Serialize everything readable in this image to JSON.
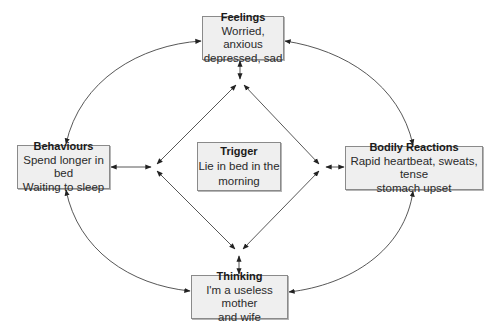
{
  "diagram": {
    "type": "CBT cycle / five-areas model",
    "nodes": {
      "feelings": {
        "title": "Feelings",
        "line1": "Worried, anxious",
        "line2": "depressed, sad"
      },
      "behaviours": {
        "title": "Behaviours",
        "line1": "Spend longer in bed",
        "line2": "Waiting to sleep"
      },
      "trigger": {
        "title": "Trigger",
        "line1": "Lie in bed in the",
        "line2": "morning"
      },
      "bodily": {
        "title": "Bodily Reactions",
        "line1": "Rapid heartbeat, sweats, tense",
        "line2": "stomach upset"
      },
      "thinking": {
        "title": "Thinking",
        "line1": "I'm a useless mother",
        "line2": "and wife"
      }
    },
    "edges": [
      {
        "from": "Feelings",
        "to": "Behaviours",
        "style": "curved",
        "arrows": "both"
      },
      {
        "from": "Feelings",
        "to": "Bodily Reactions",
        "style": "curved",
        "arrows": "both"
      },
      {
        "from": "Behaviours",
        "to": "Thinking",
        "style": "curved",
        "arrows": "both"
      },
      {
        "from": "Bodily Reactions",
        "to": "Thinking",
        "style": "curved",
        "arrows": "both"
      },
      {
        "from": "Feelings",
        "to": "Trigger-diamond",
        "style": "straight",
        "arrows": "both"
      },
      {
        "from": "Behaviours",
        "to": "Trigger-diamond",
        "style": "straight",
        "arrows": "both"
      },
      {
        "from": "Bodily Reactions",
        "to": "Trigger-diamond",
        "style": "straight",
        "arrows": "both"
      },
      {
        "from": "Thinking",
        "to": "Trigger-diamond",
        "style": "straight",
        "arrows": "both"
      }
    ],
    "colors": {
      "box_fill": "#efefef",
      "box_border": "#8a8a8a",
      "line": "#333333"
    }
  }
}
